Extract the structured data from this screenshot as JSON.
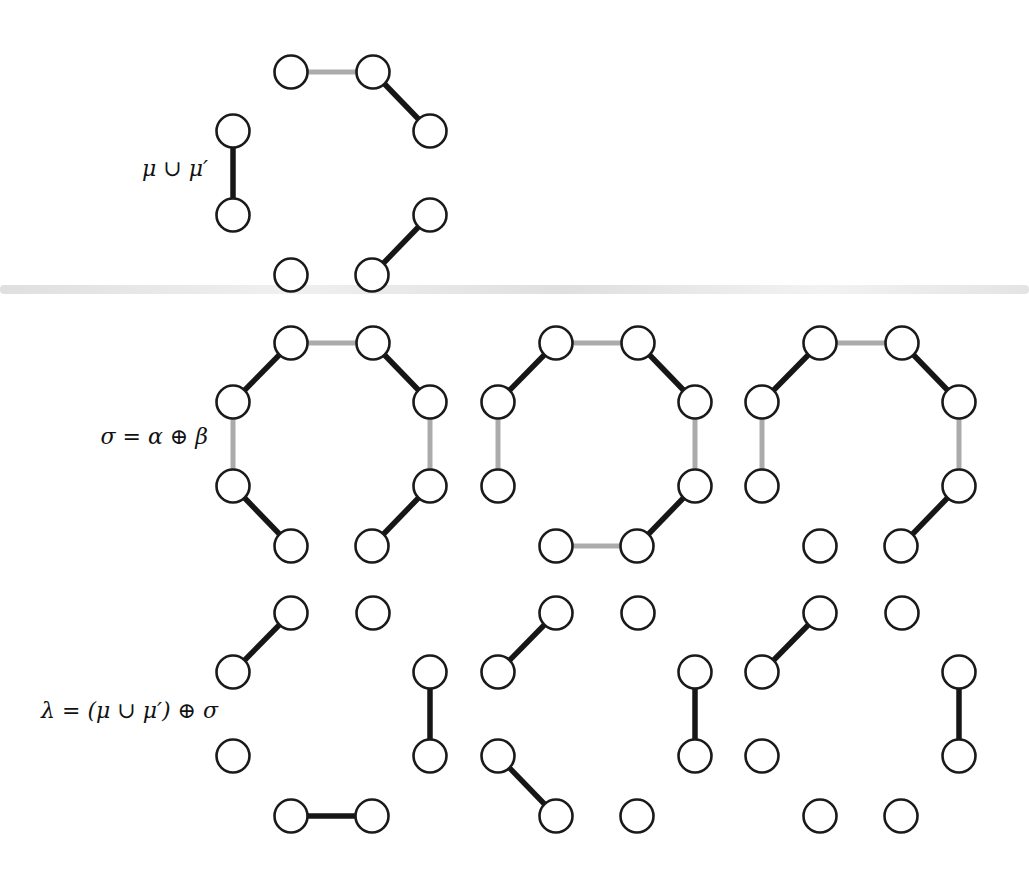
{
  "figure": {
    "type": "graph-diagram",
    "description_rows": 3
  },
  "colors": {
    "background": "#ffffff",
    "black_edge": "#161616",
    "gray_edge": "#ababab",
    "node_fill": "#ffffff",
    "node_stroke": "#1a1a1a",
    "label_text": "#111111"
  },
  "geometry": {
    "node_radius": 16.5,
    "node_stroke_width": 2.6,
    "black_edge_width": 5.5,
    "gray_edge_width": 5,
    "nodes": [
      "TL",
      "TR",
      "RT",
      "RB",
      "BR",
      "BL",
      "LB",
      "LT"
    ],
    "node_positions": {
      "TL": [
        58,
        0
      ],
      "TR": [
        140,
        0
      ],
      "RT": [
        197,
        59
      ],
      "RB": [
        197,
        143
      ],
      "BR": [
        139,
        203
      ],
      "BL": [
        58,
        203
      ],
      "LB": [
        0,
        143
      ],
      "LT": [
        0,
        59
      ]
    }
  },
  "rows": [
    {
      "label": "μ ∪ μ′",
      "diagrams": [
        {
          "edges": [
            [
              "TL",
              "TR",
              "gray"
            ],
            [
              "TR",
              "RT",
              "black"
            ],
            [
              "LT",
              "LB",
              "black"
            ],
            [
              "RB",
              "BR",
              "black"
            ]
          ],
          "isolated": [
            "BL"
          ]
        }
      ]
    },
    {
      "label": "σ = α ⊕ β",
      "diagrams": [
        {
          "edges": [
            [
              "TL",
              "TR",
              "gray"
            ],
            [
              "TR",
              "RT",
              "black"
            ],
            [
              "RT",
              "RB",
              "gray"
            ],
            [
              "RB",
              "BR",
              "black"
            ],
            [
              "TL",
              "LT",
              "black"
            ],
            [
              "LT",
              "LB",
              "gray"
            ],
            [
              "LB",
              "BL",
              "black"
            ]
          ],
          "isolated": []
        },
        {
          "edges": [
            [
              "TL",
              "TR",
              "gray"
            ],
            [
              "TR",
              "RT",
              "black"
            ],
            [
              "RT",
              "RB",
              "gray"
            ],
            [
              "RB",
              "BR",
              "black"
            ],
            [
              "BR",
              "BL",
              "gray"
            ],
            [
              "TL",
              "LT",
              "black"
            ],
            [
              "LT",
              "LB",
              "gray"
            ]
          ],
          "isolated": []
        },
        {
          "edges": [
            [
              "TL",
              "TR",
              "gray"
            ],
            [
              "TR",
              "RT",
              "black"
            ],
            [
              "RT",
              "RB",
              "gray"
            ],
            [
              "RB",
              "BR",
              "black"
            ],
            [
              "TL",
              "LT",
              "black"
            ],
            [
              "LT",
              "LB",
              "gray"
            ]
          ],
          "isolated": [
            "BL"
          ]
        }
      ]
    },
    {
      "label": "λ = (μ ∪ μ′) ⊕ σ",
      "diagrams": [
        {
          "edges": [
            [
              "LT",
              "TL",
              "black"
            ],
            [
              "RT",
              "RB",
              "black"
            ],
            [
              "BL",
              "BR",
              "black"
            ]
          ],
          "isolated": [
            "TR",
            "LB"
          ]
        },
        {
          "edges": [
            [
              "LT",
              "TL",
              "black"
            ],
            [
              "RT",
              "RB",
              "black"
            ],
            [
              "LB",
              "BL",
              "black"
            ]
          ],
          "isolated": [
            "TR",
            "BR"
          ]
        },
        {
          "edges": [
            [
              "LT",
              "TL",
              "black"
            ],
            [
              "RT",
              "RB",
              "black"
            ]
          ],
          "isolated": [
            "TR",
            "LB",
            "BL",
            "BR"
          ]
        }
      ]
    }
  ]
}
